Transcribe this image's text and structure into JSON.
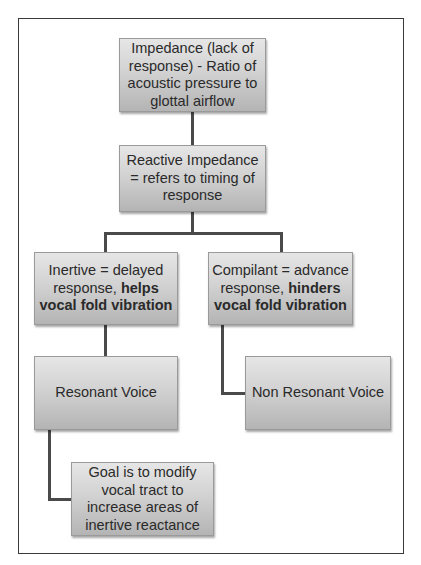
{
  "diagram": {
    "nodes": {
      "impedance": {
        "text": "Impedance (lack of response) - Ratio of acoustic pressure to glottal airflow"
      },
      "reactive": {
        "text": "Reactive Impedance = refers to timing of response"
      },
      "inertive": {
        "text_plain": "Inertive = delayed response, ",
        "text_bold": "helps vocal fold vibration"
      },
      "compliant": {
        "text_plain": "Compilant = advance response, ",
        "text_bold": "hinders vocal fold vibration"
      },
      "resonant": {
        "text": "Resonant Voice"
      },
      "non_resonant": {
        "text": "Non Resonant Voice"
      },
      "goal": {
        "text": "Goal is to modify vocal tract to increase areas of inertive reactance"
      }
    },
    "edges": [
      {
        "from": "impedance",
        "to": "reactive"
      },
      {
        "from": "reactive",
        "to": "inertive"
      },
      {
        "from": "reactive",
        "to": "compliant"
      },
      {
        "from": "inertive",
        "to": "resonant"
      },
      {
        "from": "compliant",
        "to": "non_resonant"
      },
      {
        "from": "resonant",
        "to": "goal"
      }
    ]
  }
}
